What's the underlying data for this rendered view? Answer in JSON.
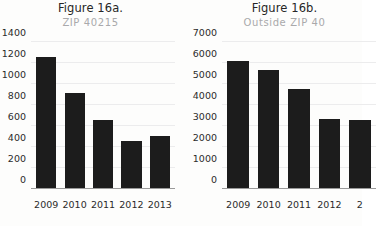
{
  "background_color": "#fdfdfc",
  "bar_color": "#1c1c1c",
  "gridline_color": "#ececed",
  "axis_color": "#9a9a9a",
  "title_color": "#262626",
  "subtitle_color": "#a9a9ab",
  "figures": [
    {
      "id": "figure-16a",
      "title": "Figure 16a.",
      "subtitle": "ZIP 40215"
    },
    {
      "id": "figure-16b",
      "title": "Figure 16b.",
      "subtitle": "Outside ZIP 40"
    }
  ],
  "chart_data": [
    {
      "type": "bar",
      "title": "Figure 16a.",
      "subtitle": "ZIP 40215",
      "categories": [
        "2009",
        "2010",
        "2011",
        "2012",
        "2013"
      ],
      "values": [
        1255,
        910,
        655,
        455,
        505
      ],
      "yticks": [
        0,
        200,
        400,
        600,
        800,
        1000,
        1200,
        1400
      ],
      "ytick_labels": [
        "0",
        "200",
        "400",
        "600",
        "800",
        "1000",
        "1200",
        "1400"
      ],
      "ylim": [
        0,
        1400
      ],
      "xlabel": "",
      "ylabel": "",
      "grid": true,
      "legend": "none"
    },
    {
      "type": "bar",
      "title": "Figure 16b.",
      "subtitle": "Outside ZIP 40",
      "categories": [
        "2009",
        "2010",
        "2011",
        "2012",
        "2"
      ],
      "values": [
        6100,
        5650,
        4750,
        3320,
        3300
      ],
      "yticks": [
        0,
        1000,
        2000,
        3000,
        4000,
        5000,
        6000,
        7000
      ],
      "ytick_labels": [
        "0",
        "1000",
        "2000",
        "3000",
        "4000",
        "5000",
        "6000",
        "7000"
      ],
      "ylim": [
        0,
        7000
      ],
      "xlabel": "",
      "ylabel": "",
      "grid": true,
      "legend": "none",
      "clipped_right_edge": true
    }
  ]
}
